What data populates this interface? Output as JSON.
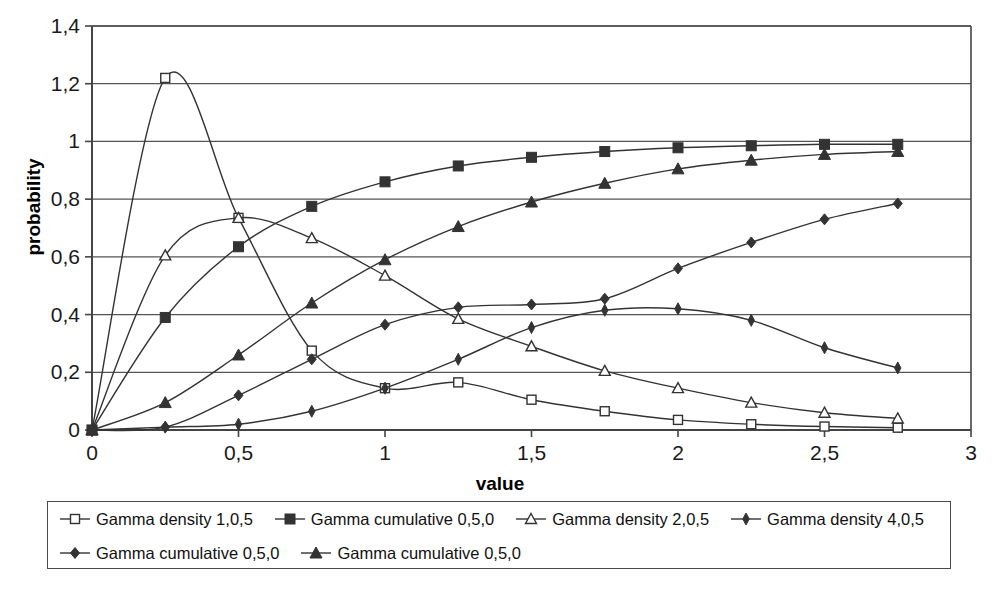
{
  "chart_data": {
    "type": "line",
    "title": "",
    "xlabel": "value",
    "ylabel": "probability",
    "xlim": [
      0,
      3
    ],
    "ylim": [
      0,
      1.4
    ],
    "grid": true,
    "legend_position": "bottom",
    "x_ticks": [
      "0",
      "0,5",
      "1",
      "1,5",
      "2",
      "2,5",
      "3"
    ],
    "x_tick_values": [
      0,
      0.5,
      1,
      1.5,
      2,
      2.5,
      3
    ],
    "y_ticks": [
      "0",
      "0,2",
      "0,4",
      "0,6",
      "0,8",
      "1",
      "1,2",
      "1,4"
    ],
    "y_tick_values": [
      0,
      0.2,
      0.4,
      0.6,
      0.8,
      1.0,
      1.2,
      1.4
    ],
    "x": [
      0,
      0.25,
      0.5,
      0.75,
      1.0,
      1.25,
      1.5,
      1.75,
      2.0,
      2.25,
      2.5,
      2.75
    ],
    "series": [
      {
        "name": "Gamma density 1,0,5",
        "marker": "open-square",
        "values": [
          0,
          1.22,
          0.735,
          0.275,
          0.145,
          0.165,
          0.105,
          0.065,
          0.035,
          0.02,
          0.012,
          0.008
        ]
      },
      {
        "name": "Gamma cumulative 0,5,0",
        "marker": "filled-square",
        "values": [
          0,
          0.39,
          0.635,
          0.775,
          0.86,
          0.915,
          0.945,
          0.965,
          0.978,
          0.985,
          0.99,
          0.99
        ]
      },
      {
        "name": "Gamma density 2,0,5",
        "marker": "open-triangle",
        "values": [
          0,
          0.605,
          0.735,
          0.665,
          0.535,
          0.385,
          0.29,
          0.205,
          0.145,
          0.095,
          0.06,
          0.04
        ]
      },
      {
        "name": "Gamma density 4,0,5",
        "marker": "filled-diamond-small",
        "values": [
          0,
          0.01,
          0.02,
          0.065,
          0.145,
          0.245,
          0.355,
          0.415,
          0.42,
          0.38,
          0.285,
          0.215
        ]
      },
      {
        "name": "Gamma cumulative 0,5,0",
        "marker": "filled-diamond",
        "values": [
          0,
          0.01,
          0.12,
          0.245,
          0.365,
          0.425,
          0.435,
          0.455,
          0.56,
          0.65,
          0.73,
          0.785
        ]
      },
      {
        "name": "Gamma cumulative 0,5,0",
        "marker": "filled-triangle",
        "values": [
          0,
          0.095,
          0.26,
          0.44,
          0.59,
          0.705,
          0.79,
          0.855,
          0.905,
          0.935,
          0.955,
          0.965
        ]
      }
    ],
    "colors": {
      "line": "#333333",
      "grid": "#555555",
      "axis": "#444444",
      "text": "#111111",
      "background": "#ffffff"
    }
  },
  "legend": {
    "rows": [
      [
        {
          "label": "Gamma density 1,0,5",
          "marker": "open-square"
        },
        {
          "label": "Gamma cumulative 0,5,0",
          "marker": "filled-square"
        },
        {
          "label": "Gamma density 2,0,5",
          "marker": "open-triangle"
        },
        {
          "label": "Gamma density 4,0,5",
          "marker": "filled-diamond-small"
        }
      ],
      [
        {
          "label": "Gamma cumulative 0,5,0",
          "marker": "filled-diamond"
        },
        {
          "label": "Gamma cumulative 0,5,0",
          "marker": "filled-triangle"
        }
      ]
    ]
  }
}
